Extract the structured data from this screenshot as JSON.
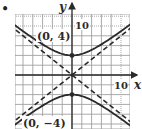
{
  "bullet": "•",
  "chart_data": {
    "type": "line",
    "title": "",
    "xlabel": "x",
    "ylabel": "y",
    "xlim": [
      -12,
      12
    ],
    "ylim": [
      -11,
      12
    ],
    "grid": true,
    "grid_step": 2,
    "tick_labels": {
      "x": [
        "10"
      ],
      "y": [
        "10"
      ]
    },
    "series": [
      {
        "name": "hyperbola upper branch",
        "style": "solid",
        "equation": "y^2/16 - x^2/25 = 1",
        "vertex": [
          0,
          4
        ]
      },
      {
        "name": "hyperbola lower branch",
        "style": "solid",
        "equation": "y^2/16 - x^2/25 = 1",
        "vertex": [
          0,
          -4
        ]
      },
      {
        "name": "asymptote",
        "style": "dashed",
        "equation": "y = 4/5 x"
      },
      {
        "name": "asymptote",
        "style": "dashed",
        "equation": "y = -4/5 x"
      }
    ],
    "annotations": [
      {
        "text": "(0, 4)",
        "point": [
          0,
          4
        ]
      },
      {
        "text": "(0, −4)",
        "point": [
          0,
          -4
        ]
      }
    ]
  },
  "labels": {
    "x_axis": "x",
    "y_axis": "y",
    "x_tick": "10",
    "y_tick": "10",
    "vertex_top": "(0, 4)",
    "vertex_bottom": "(0, −4)"
  },
  "colors": {
    "curve": "#2a2a2a",
    "grid": "#9a9a9a",
    "axis": "#2a2a2a"
  }
}
